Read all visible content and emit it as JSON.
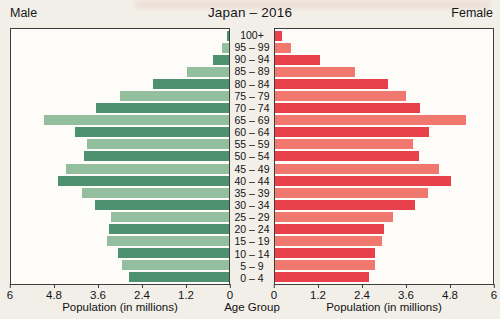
{
  "title": "Japan – 2016",
  "left_header": "Male",
  "right_header": "Female",
  "colors": {
    "male_dark": "#4e9170",
    "male_light": "#93bf9f",
    "female_dark": "#e8414b",
    "female_light": "#f1786e",
    "panel_border": "#3d3d3d",
    "background": "#f2efe9",
    "panel_background": "#fdfcf9",
    "text": "#161616"
  },
  "chart_data": {
    "type": "bar",
    "variant": "population_pyramid",
    "title": "Japan – 2016",
    "categories": [
      "100+",
      "95 – 99",
      "90 – 94",
      "85 – 89",
      "80 – 84",
      "75 – 79",
      "70 – 74",
      "65 – 69",
      "60 – 64",
      "55 – 59",
      "50 – 54",
      "45 – 49",
      "40 – 44",
      "35 – 39",
      "30 – 34",
      "25 – 29",
      "20 – 24",
      "15 – 19",
      "10 – 14",
      "5 – 9",
      "0 – 4"
    ],
    "series": [
      {
        "name": "Male",
        "side": "left",
        "values": [
          0.05,
          0.2,
          0.45,
          1.15,
          2.1,
          3.0,
          3.65,
          5.1,
          4.25,
          3.9,
          4.0,
          4.5,
          4.7,
          4.05,
          3.7,
          3.25,
          3.3,
          3.35,
          3.05,
          2.95,
          2.75
        ]
      },
      {
        "name": "Female",
        "side": "right",
        "values": [
          0.2,
          0.45,
          1.25,
          2.2,
          3.1,
          3.6,
          4.0,
          5.25,
          4.25,
          3.8,
          3.95,
          4.5,
          4.85,
          4.2,
          3.85,
          3.25,
          3.0,
          2.95,
          2.75,
          2.75,
          2.6
        ]
      }
    ],
    "xlabel_left": "Population (in millions)",
    "xlabel_right": "Population (in millions)",
    "center_label": "Age Group",
    "ylabel": "Age Group",
    "xlim": [
      0,
      6
    ],
    "ticks_left": [
      6,
      4.8,
      3.6,
      2.4,
      1.2,
      0
    ],
    "ticks_right": [
      0,
      1.2,
      2.4,
      3.6,
      4.8,
      6
    ],
    "grid": false,
    "legend_position": "none"
  }
}
